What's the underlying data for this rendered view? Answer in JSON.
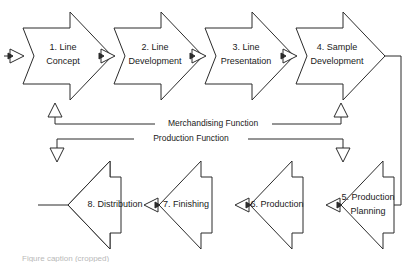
{
  "diagram": {
    "type": "process-flow-chevron",
    "background_color": "#ffffff",
    "stroke_color": "#2b2b2b",
    "fill_color": "#ffffff",
    "stages": [
      {
        "id": "stage-1",
        "number": "1.",
        "line1": "1. Line",
        "line2": "Concept",
        "row": "top",
        "direction": "right"
      },
      {
        "id": "stage-2",
        "number": "2.",
        "line1": "2. Line",
        "line2": "Development",
        "row": "top",
        "direction": "right"
      },
      {
        "id": "stage-3",
        "number": "3.",
        "line1": "3. Line",
        "line2": "Presentation",
        "row": "top",
        "direction": "right"
      },
      {
        "id": "stage-4",
        "number": "4.",
        "line1": "4. Sample",
        "line2": "Development",
        "row": "top",
        "direction": "right"
      },
      {
        "id": "stage-5",
        "number": "5.",
        "line1": "5. Production",
        "line2": "Planning",
        "row": "bottom",
        "direction": "left"
      },
      {
        "id": "stage-6",
        "number": "6.",
        "line1": "6. Production",
        "line2": "",
        "row": "bottom",
        "direction": "left"
      },
      {
        "id": "stage-7",
        "number": "7.",
        "line1": "7. Finishing",
        "line2": "",
        "row": "bottom",
        "direction": "left"
      },
      {
        "id": "stage-8",
        "number": "8.",
        "line1": "8. Distribution",
        "line2": "",
        "row": "bottom",
        "direction": "left"
      }
    ],
    "functions": [
      {
        "id": "merchandising",
        "label": "Merchandising Function",
        "spans": "stage-1 to stage-4",
        "arrow_direction": "up"
      },
      {
        "id": "production",
        "label": "Production Function",
        "spans": "stage-8 to stage-5",
        "arrow_direction": "down"
      }
    ],
    "connectors": [
      {
        "id": "input-arrow",
        "from": "external",
        "to": "stage-1",
        "style": "solid-triangle-right"
      },
      {
        "id": "c-1-2",
        "from": "stage-1",
        "to": "stage-2",
        "style": "solid-triangle-right"
      },
      {
        "id": "c-2-3",
        "from": "stage-2",
        "to": "stage-3",
        "style": "solid-triangle-right"
      },
      {
        "id": "c-3-4",
        "from": "stage-3",
        "to": "stage-4",
        "style": "solid-triangle-right"
      },
      {
        "id": "c-4-5",
        "from": "stage-4",
        "to": "stage-5",
        "style": "wraparound-right-down"
      },
      {
        "id": "c-5-6",
        "from": "stage-5",
        "to": "stage-6",
        "style": "solid-triangle-left"
      },
      {
        "id": "c-6-7",
        "from": "stage-6",
        "to": "stage-7",
        "style": "solid-triangle-left"
      },
      {
        "id": "c-7-8",
        "from": "stage-7",
        "to": "stage-8",
        "style": "solid-triangle-left"
      },
      {
        "id": "output-arrow",
        "from": "stage-8",
        "to": "external",
        "style": "line-left"
      }
    ]
  },
  "caption": {
    "partial_text": "Figure caption (cropped)"
  }
}
